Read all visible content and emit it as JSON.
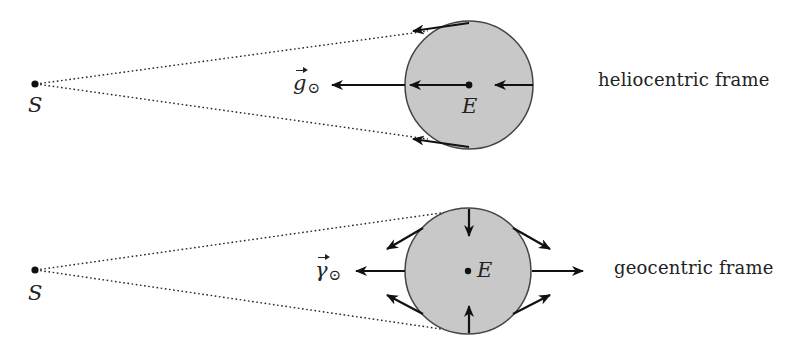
{
  "colors": {
    "earth_fill": "#c8c8c8",
    "earth_stroke": "#444444",
    "ink": "#111111",
    "background": "#ffffff"
  },
  "panels": [
    {
      "id": "heliocentric",
      "frame_label": "heliocentric frame",
      "sun_label": "S",
      "earth_label": "E",
      "vector_label": "g",
      "vector_subscript": "⊙",
      "sun": {
        "x": 35,
        "y": 84
      },
      "earth": {
        "x": 469,
        "y": 85,
        "r": 64
      },
      "arrows": [
        {
          "name": "gravity-arrow-outside",
          "direction": "left"
        },
        {
          "name": "gravity-arrow-center",
          "direction": "left"
        },
        {
          "name": "gravity-arrow-right-edge",
          "direction": "left"
        },
        {
          "name": "gravity-arrow-top",
          "direction": "left-tangent"
        },
        {
          "name": "gravity-arrow-bottom",
          "direction": "left-tangent"
        }
      ]
    },
    {
      "id": "geocentric",
      "frame_label": "geocentric frame",
      "sun_label": "S",
      "earth_label": "E",
      "vector_label": "γ",
      "vector_subscript": "⊙",
      "sun": {
        "x": 35,
        "y": 270
      },
      "earth": {
        "x": 468,
        "y": 271,
        "r": 63
      },
      "arrows": [
        {
          "name": "tidal-arrow-left",
          "direction": "left"
        },
        {
          "name": "tidal-arrow-right",
          "direction": "right"
        },
        {
          "name": "tidal-arrow-top",
          "direction": "down"
        },
        {
          "name": "tidal-arrow-bottom",
          "direction": "up"
        },
        {
          "name": "tidal-arrow-upper-left",
          "direction": "up-left-out"
        },
        {
          "name": "tidal-arrow-upper-right",
          "direction": "down-right-out"
        },
        {
          "name": "tidal-arrow-lower-left",
          "direction": "up-left-out"
        },
        {
          "name": "tidal-arrow-lower-right",
          "direction": "up-right-out"
        }
      ]
    }
  ]
}
